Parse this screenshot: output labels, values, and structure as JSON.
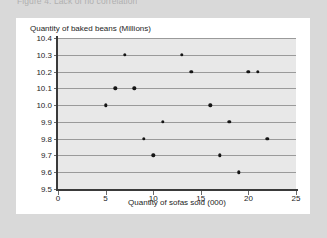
{
  "page": {
    "background_color": "#d9d9d9",
    "card_background_color": "#ffffff"
  },
  "figure": {
    "caption": "Figure 4: Lack of no correlation"
  },
  "chart_data": {
    "type": "scatter",
    "title": "",
    "xlabel": "Quantity of sofas sold (000)",
    "ylabel": "Quantity of baked beans (Millions)",
    "xlim": [
      0,
      25
    ],
    "ylim": [
      9.5,
      10.4
    ],
    "xticks": [
      0,
      5,
      10,
      15,
      20,
      25
    ],
    "xtick_labels": [
      "0",
      "5",
      "10",
      "15",
      "20",
      "25"
    ],
    "yticks": [
      9.5,
      9.6,
      9.7,
      9.8,
      9.9,
      10.0,
      10.1,
      10.2,
      10.3,
      10.4
    ],
    "ytick_labels": [
      "9.5",
      "9.6",
      "9.7",
      "9.8",
      "9.9",
      "10.0",
      "10.1",
      "10.2",
      "10.3",
      "10.4"
    ],
    "grid": "horizontal",
    "legend": "none",
    "plot_background_color": "#e8e8e8",
    "gridline_color": "#9a9a9a",
    "axis_color": "#3a3a3a",
    "marker_color": "#151515",
    "points": [
      {
        "x": 5,
        "y": 10.0
      },
      {
        "x": 6,
        "y": 10.1
      },
      {
        "x": 7,
        "y": 10.3
      },
      {
        "x": 8,
        "y": 10.1
      },
      {
        "x": 9,
        "y": 9.8
      },
      {
        "x": 10,
        "y": 9.7
      },
      {
        "x": 11,
        "y": 9.9
      },
      {
        "x": 13,
        "y": 10.3
      },
      {
        "x": 14,
        "y": 10.2
      },
      {
        "x": 16,
        "y": 10.0
      },
      {
        "x": 17,
        "y": 9.7
      },
      {
        "x": 18,
        "y": 9.9
      },
      {
        "x": 19,
        "y": 9.6
      },
      {
        "x": 20,
        "y": 10.2
      },
      {
        "x": 21,
        "y": 10.2
      },
      {
        "x": 22,
        "y": 9.8
      }
    ]
  }
}
